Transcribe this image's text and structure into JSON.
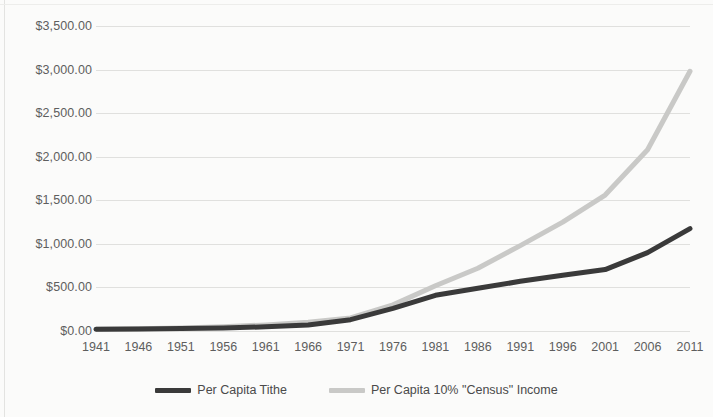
{
  "chart_data": {
    "type": "line",
    "title": "",
    "xlabel": "",
    "ylabel": "",
    "grid": "horizontal",
    "legend_position": "bottom",
    "x": [
      1941,
      1946,
      1951,
      1956,
      1961,
      1966,
      1971,
      1976,
      1981,
      1986,
      1991,
      1996,
      2001,
      2006,
      2011
    ],
    "categories": [
      "1941",
      "1946",
      "1951",
      "1956",
      "1961",
      "1966",
      "1971",
      "1976",
      "1981",
      "1986",
      "1991",
      "1996",
      "2001",
      "2006",
      "2011"
    ],
    "xlim": [
      1941,
      2011
    ],
    "ylim": [
      0,
      3500
    ],
    "y_ticks": [
      0,
      500,
      1000,
      1500,
      2000,
      2500,
      3000,
      3500
    ],
    "y_tick_labels": [
      "$0.00",
      "$500.00",
      "$1,000.00",
      "$1,500.00",
      "$2,000.00",
      "$2,500.00",
      "$3,000.00",
      "$3,500.00"
    ],
    "series": [
      {
        "name": "Per Capita Tithe",
        "color": "#3a3a3a",
        "width": 5,
        "values": [
          20,
          22,
          28,
          35,
          48,
          70,
          130,
          260,
          410,
          490,
          570,
          640,
          705,
          900,
          1175
        ]
      },
      {
        "name": "Per Capita 10% \"Census\" Income",
        "color": "#c9c9c7",
        "width": 5,
        "values": [
          20,
          25,
          35,
          50,
          70,
          100,
          150,
          300,
          520,
          720,
          980,
          1250,
          1560,
          2080,
          2980
        ]
      }
    ]
  },
  "legend": {
    "items": [
      {
        "label": "Per Capita Tithe",
        "color": "#3a3a3a"
      },
      {
        "label": "Per Capita 10% \"Census\" Income",
        "color": "#c9c9c7"
      }
    ]
  }
}
